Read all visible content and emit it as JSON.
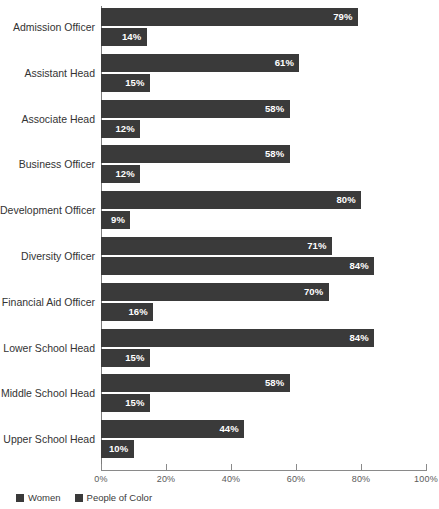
{
  "chart_data": {
    "type": "bar",
    "orientation": "horizontal",
    "title": "",
    "xlabel": "",
    "ylabel": "",
    "xlim": [
      0,
      100
    ],
    "xticks": [
      "0%",
      "20%",
      "40%",
      "60%",
      "80%",
      "100%"
    ],
    "xtick_values": [
      0,
      20,
      40,
      60,
      80,
      100
    ],
    "grid": false,
    "legend_position": "bottom-left",
    "value_suffix": "%",
    "categories": [
      "Admission Officer",
      "Assistant Head",
      "Associate Head",
      "Business Officer",
      "Development Officer",
      "Diversity Officer",
      "Financial Aid Officer",
      "Lower School Head",
      "Middle School Head",
      "Upper School Head"
    ],
    "series": [
      {
        "name": "Women",
        "color": "#3a3a3a",
        "values": [
          79,
          61,
          58,
          58,
          80,
          71,
          70,
          84,
          58,
          44
        ],
        "labels": [
          "79%",
          "61%",
          "58%",
          "58%",
          "80%",
          "71%",
          "70%",
          "84%",
          "58%",
          "44%"
        ]
      },
      {
        "name": "People of Color",
        "color": "#3a3a3a",
        "values": [
          14,
          15,
          12,
          12,
          9,
          84,
          16,
          15,
          15,
          10
        ],
        "labels": [
          "14%",
          "15%",
          "12%",
          "12%",
          "9%",
          "84%",
          "16%",
          "15%",
          "15%",
          "10%"
        ]
      }
    ]
  },
  "colors": {
    "bar": "#3a3a3a",
    "axis": "#8a8a8a",
    "value_label": "#ffffff",
    "category_label": "#333333",
    "tick_label": "#5a5a5a",
    "background": "#ffffff"
  }
}
